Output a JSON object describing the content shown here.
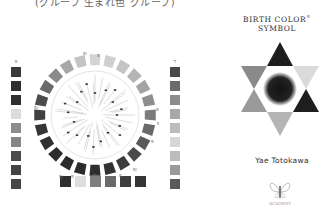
{
  "caption": "(グループ 生まれ色 グループ)",
  "left_column": {
    "label": "B",
    "swatches": [
      "#3a3a3a",
      "#2e2e2e",
      "#2f2f2f",
      "#dcdcdc",
      "#8c8c8c",
      "#868686",
      "#4a4a4a",
      "#444444",
      "#474747"
    ]
  },
  "right_column": {
    "label": "T",
    "swatches": [
      "#4a4a4a",
      "#6b6b6b",
      "#8c8c8c",
      "#a8a8a8",
      "#bdbdbd",
      "#d6d6d6",
      "#bcbcbc",
      "#9a9a9a",
      "#5a5a5a"
    ]
  },
  "bottom_row": {
    "swatches": [
      "#2f2f2f",
      "#dedede",
      "#7e7e7e",
      "#6a6a6a",
      "#3e3e3e",
      "#353535"
    ]
  },
  "wheel": {
    "segments": [
      "#d4d4d4",
      "#d0d0d0",
      "#c4c4c4",
      "#b4b4b4",
      "#a4a4a4",
      "#8e8e8e",
      "#7c7c7c",
      "#6a6a6a",
      "#5a5a5a",
      "#4a4a4a",
      "#3c3c3c",
      "#323232",
      "#2e2e2e",
      "#2c2c2c",
      "#2a2a2a",
      "#2c2c2c",
      "#303030",
      "#363636",
      "#404040",
      "#4c4c4c",
      "#6a6a6a",
      "#8a8a8a",
      "#a8a8a8",
      "#c4c4c4"
    ],
    "labels": [
      "B/",
      "B",
      "B",
      "B/",
      "B/",
      "B/",
      "B",
      "B/",
      "B",
      "B/",
      "B"
    ]
  },
  "title": {
    "line1": "BIRTH COLOR",
    "reg": "®",
    "line2": "SYMBOL"
  },
  "star": {
    "top": "#1e1e1e",
    "upper_left": "#8a8a8a",
    "upper_right": "#dadada",
    "lower_left": "#9a9a9a",
    "lower_right": "#1e1e1e",
    "bottom": "#b4b4b4",
    "center": "#111111"
  },
  "author": "Yae Totokawa",
  "logo": {
    "text": "ACADEMY"
  }
}
